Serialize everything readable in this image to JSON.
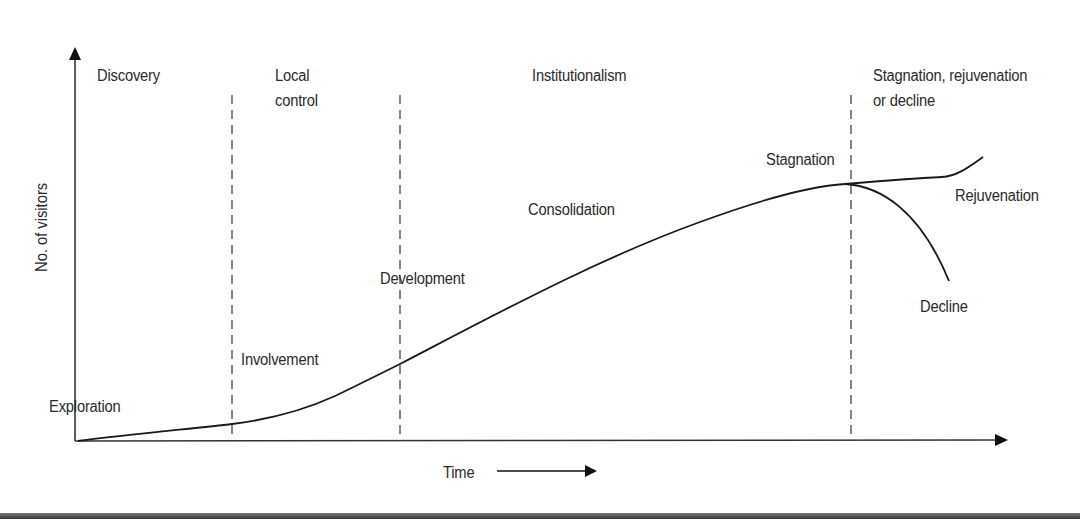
{
  "diagram": {
    "type": "tourism-area-life-cycle",
    "axes": {
      "y_label": "No. of visitors",
      "x_label": "Time"
    },
    "phases": [
      {
        "id": "discovery",
        "label_lines": [
          "Discovery"
        ]
      },
      {
        "id": "local-control",
        "label_lines": [
          "Local",
          "control"
        ]
      },
      {
        "id": "institutionalism",
        "label_lines": [
          "Institutionalism"
        ]
      },
      {
        "id": "stagnation-rejuvenation-decline",
        "label_lines": [
          "Stagnation, rejuvenation",
          "or decline"
        ]
      }
    ],
    "stages": {
      "exploration": "Exploration",
      "involvement": "Involvement",
      "development": "Development",
      "consolidation": "Consolidation",
      "stagnation": "Stagnation",
      "rejuvenation": "Rejuvenation",
      "decline": "Decline"
    },
    "colors": {
      "line": "#1a1a1a",
      "text": "#2b2b2b",
      "dashed": "#444444",
      "background": "#ffffff"
    }
  }
}
